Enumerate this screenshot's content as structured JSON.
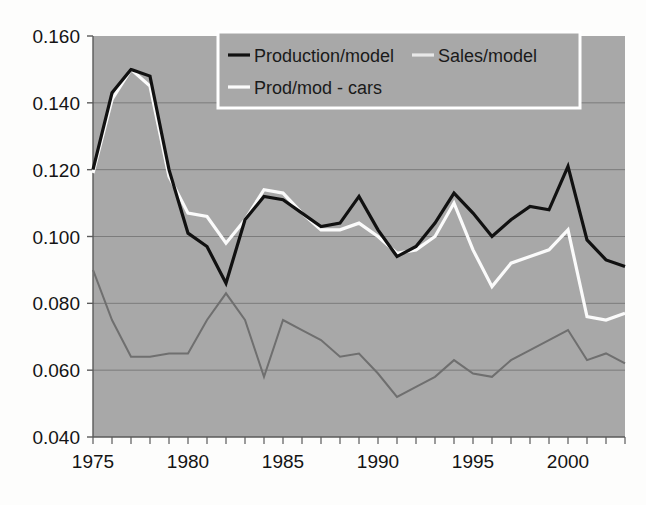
{
  "chart_data": {
    "type": "line",
    "title": "",
    "xlabel": "",
    "ylabel": "",
    "grid": true,
    "legend_position": "top-center",
    "xlim": [
      1975,
      2003
    ],
    "ylim": [
      0.04,
      0.16
    ],
    "yticks": [
      "0.160",
      "0.140",
      "0.120",
      "0.100",
      "0.080",
      "0.060",
      "0.040"
    ],
    "ytick_values": [
      0.16,
      0.14,
      0.12,
      0.1,
      0.08,
      0.06,
      0.04
    ],
    "xticks": [
      "1975",
      "1980",
      "1985",
      "1990",
      "1995",
      "2000"
    ],
    "xtick_values": [
      1975,
      1980,
      1985,
      1990,
      1995,
      2000
    ],
    "x": [
      1975,
      1976,
      1977,
      1978,
      1979,
      1980,
      1981,
      1982,
      1983,
      1984,
      1985,
      1986,
      1987,
      1988,
      1989,
      1990,
      1991,
      1992,
      1993,
      1994,
      1995,
      1996,
      1997,
      1998,
      1999,
      2000,
      2001,
      2002,
      2003
    ],
    "series": [
      {
        "name": "Production/model",
        "color": "#111111",
        "width": 3.2,
        "values": [
          0.12,
          0.143,
          0.15,
          0.148,
          0.12,
          0.101,
          0.097,
          0.086,
          0.105,
          0.112,
          0.111,
          0.107,
          0.103,
          0.104,
          0.112,
          0.102,
          0.094,
          0.097,
          0.104,
          0.113,
          0.107,
          0.1,
          0.105,
          0.109,
          0.108,
          0.121,
          0.099,
          0.093,
          0.091
        ]
      },
      {
        "name": "Sales/model",
        "color": "#fbfbfb",
        "width": 3.2,
        "values": [
          0.119,
          0.141,
          0.15,
          0.145,
          0.118,
          0.107,
          0.106,
          0.098,
          0.105,
          0.114,
          0.113,
          0.107,
          0.102,
          0.102,
          0.104,
          0.1,
          0.095,
          0.096,
          0.1,
          0.11,
          0.096,
          0.085,
          0.092,
          0.094,
          0.096,
          0.102,
          0.076,
          0.075,
          0.077
        ]
      },
      {
        "name": "Prod/mod - cars",
        "color": "#6f6f6f",
        "width": 2.0,
        "values": [
          0.09,
          0.075,
          0.064,
          0.064,
          0.065,
          0.065,
          0.075,
          0.083,
          0.075,
          0.058,
          0.075,
          0.072,
          0.069,
          0.064,
          0.065,
          0.059,
          0.052,
          0.055,
          0.058,
          0.063,
          0.059,
          0.058,
          0.063,
          0.066,
          0.069,
          0.072,
          0.063,
          0.065,
          0.062
        ]
      }
    ]
  },
  "legend": {
    "entries": [
      {
        "label": "Production/model",
        "swatch_color": "#111111"
      },
      {
        "label": "Sales/model",
        "swatch_color": "#e8e8e8"
      },
      {
        "label": "Prod/mod - cars",
        "swatch_color": "#fbfbfb"
      }
    ]
  },
  "plot": {
    "background_color": "#a8a8a8",
    "gridline_color": "#7c7c7c",
    "axis_color": "#5a5a5a",
    "page_background": "#fdfdfc"
  }
}
